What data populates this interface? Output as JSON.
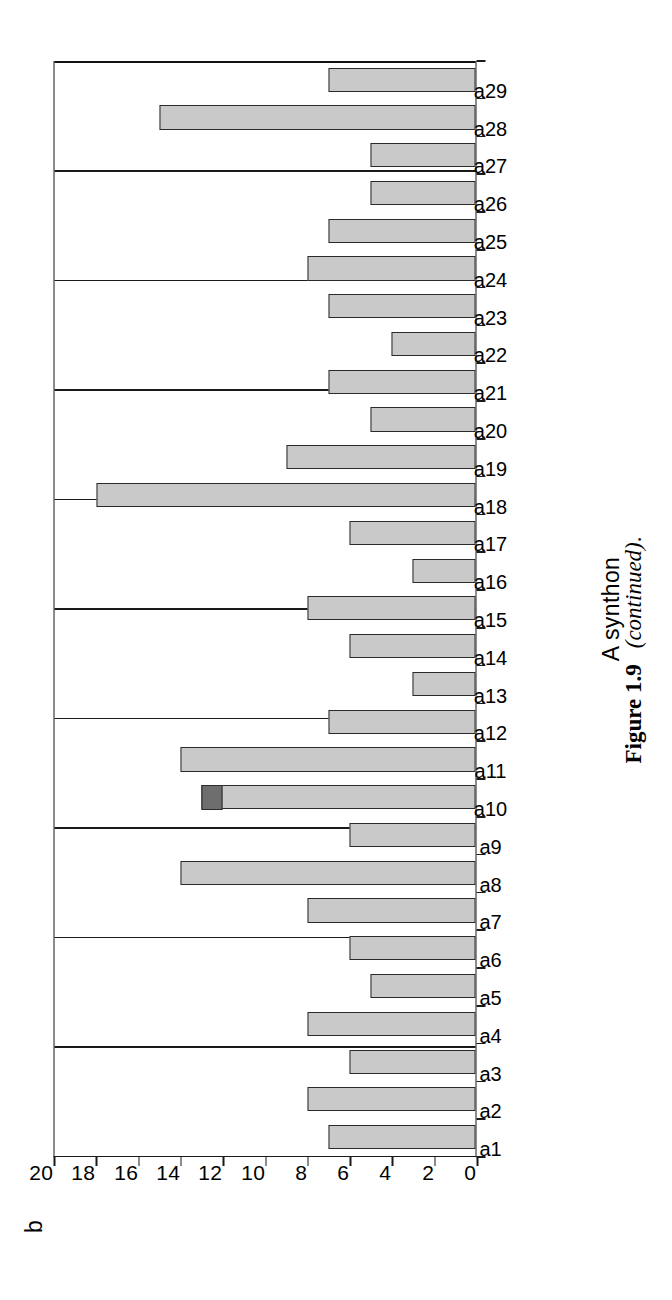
{
  "figure": {
    "panel_letter": "b",
    "caption_bold": "Figure 1.9",
    "caption_italic": "(continued)",
    "caption_tail": "."
  },
  "chart_data": {
    "type": "bar",
    "orientation": "horizontal-printed-sideways",
    "title": "",
    "xlabel": "A synthon",
    "ylabel": "",
    "ylim": [
      0,
      20
    ],
    "ytick_step": 2,
    "grid": true,
    "legend": "none",
    "bar_color": "#c9c9c9",
    "bar_edge_color": "#2a2a2a",
    "highlight_color": "#6e6e6e",
    "yticks": [
      "0",
      "2",
      "4",
      "6",
      "8",
      "10",
      "12",
      "14",
      "16",
      "18",
      "20"
    ],
    "categories": [
      "a1",
      "a2",
      "a3",
      "a4",
      "a5",
      "a6",
      "a7",
      "a8",
      "a9",
      "a10",
      "a11",
      "a12",
      "a13",
      "a14",
      "a15",
      "a16",
      "a17",
      "a18",
      "a19",
      "a20",
      "a21",
      "a22",
      "a23",
      "a24",
      "a25",
      "a26",
      "a27",
      "a28",
      "a29"
    ],
    "values": [
      7,
      8,
      6,
      8,
      5,
      6,
      8,
      14,
      6,
      13,
      14,
      7,
      3,
      6,
      8,
      3,
      6,
      18,
      9,
      5,
      7,
      4,
      7,
      8,
      7,
      5,
      5,
      15,
      7
    ],
    "highlight_segments": [
      {
        "category": "a10",
        "from": 12,
        "to": 13
      }
    ]
  }
}
